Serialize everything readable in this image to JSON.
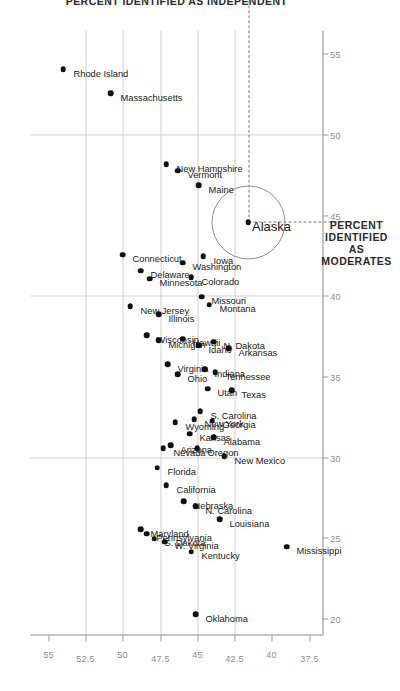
{
  "chart_data": {
    "type": "scatter",
    "title": "",
    "xlabel": "PERCENT IDENTIFIED AS INDEPENDENT",
    "ylabel": "PERCENT IDENTIFIED AS MODERATES",
    "xlim": [
      19.0,
      56.5
    ],
    "ylim": [
      36.6,
      56.2
    ],
    "xticks": [
      20,
      25,
      30,
      35,
      40,
      45,
      50,
      55
    ],
    "xticklabels": [
      "20",
      "25",
      "30",
      "35",
      "40",
      "45",
      "50",
      "55"
    ],
    "yticks": [
      37.5,
      40,
      42.5,
      45,
      47.5,
      50,
      52.5,
      55
    ],
    "yticklabels": [
      "37.5",
      "40",
      "42.5",
      "45",
      "47.5",
      "50",
      "52.5",
      "55"
    ],
    "grid": true,
    "gridlines_x": [
      30,
      40,
      50
    ],
    "gridlines_y": [
      42.5,
      45,
      47.5,
      50,
      52.5
    ],
    "legend": "none",
    "point_color": "#111111",
    "grid_color": "#cfcfcf",
    "highlight": {
      "label": "Alaska",
      "x": 44.6,
      "y": 41.6,
      "marker": "circle-outline",
      "crosshair": "dashed"
    },
    "points": [
      {
        "label": "Rhode Island",
        "x": 54.1,
        "y": 54.0
      },
      {
        "label": "Massachusetts",
        "x": 52.6,
        "y": 50.8
      },
      {
        "label": "New Hampshire",
        "x": 48.2,
        "y": 47.1
      },
      {
        "label": "Vermont",
        "x": 47.8,
        "y": 46.3
      },
      {
        "label": "Maine",
        "x": 46.9,
        "y": 44.9
      },
      {
        "label": "Connecticut",
        "x": 42.6,
        "y": 50.0
      },
      {
        "label": "Delaware",
        "x": 41.6,
        "y": 48.8
      },
      {
        "label": "Minnesota",
        "x": 41.1,
        "y": 48.2
      },
      {
        "label": "New Jersey",
        "x": 39.4,
        "y": 49.5
      },
      {
        "label": "Illinois",
        "x": 38.9,
        "y": 47.6
      },
      {
        "label": "Washington",
        "x": 42.1,
        "y": 46.0
      },
      {
        "label": "Colorado",
        "x": 41.2,
        "y": 45.4
      },
      {
        "label": "Iowa",
        "x": 42.5,
        "y": 44.6
      },
      {
        "label": "Missouri",
        "x": 40.0,
        "y": 44.7
      },
      {
        "label": "Montana",
        "x": 39.5,
        "y": 44.2
      },
      {
        "label": "Wisconsin",
        "x": 37.6,
        "y": 48.4
      },
      {
        "label": "Michigan",
        "x": 37.3,
        "y": 47.6
      },
      {
        "label": "Hawaii",
        "x": 37.4,
        "y": 46.0
      },
      {
        "label": "Virginia",
        "x": 35.8,
        "y": 47.0
      },
      {
        "label": "Ohio",
        "x": 35.2,
        "y": 46.3
      },
      {
        "label": "Idaho",
        "x": 37.0,
        "y": 44.9
      },
      {
        "label": "N. Dakota",
        "x": 37.2,
        "y": 43.9
      },
      {
        "label": "Arkansas",
        "x": 36.8,
        "y": 42.9
      },
      {
        "label": "Indiana",
        "x": 35.5,
        "y": 44.5
      },
      {
        "label": "Tennessee",
        "x": 35.3,
        "y": 43.8
      },
      {
        "label": "Utah",
        "x": 34.3,
        "y": 44.3
      },
      {
        "label": "S. Carolina",
        "x": 32.9,
        "y": 44.8
      },
      {
        "label": "New York",
        "x": 32.4,
        "y": 45.2
      },
      {
        "label": "Texas",
        "x": 34.2,
        "y": 42.7
      },
      {
        "label": "Georgia",
        "x": 32.3,
        "y": 44.0
      },
      {
        "label": "Kansas",
        "x": 31.5,
        "y": 45.5
      },
      {
        "label": "Wyoming",
        "x": 32.2,
        "y": 46.5
      },
      {
        "label": "Arizona",
        "x": 30.8,
        "y": 46.8
      },
      {
        "label": "Nevada",
        "x": 30.6,
        "y": 47.3
      },
      {
        "label": "Alabama",
        "x": 31.3,
        "y": 43.9
      },
      {
        "label": "New Mexico",
        "x": 30.1,
        "y": 43.2
      },
      {
        "label": "Oregon",
        "x": 30.6,
        "y": 45.0
      },
      {
        "label": "Florida",
        "x": 29.4,
        "y": 47.7
      },
      {
        "label": "California",
        "x": 28.3,
        "y": 47.1
      },
      {
        "label": "Nebraska",
        "x": 27.3,
        "y": 45.9
      },
      {
        "label": "N. Carolina",
        "x": 27.0,
        "y": 45.1
      },
      {
        "label": "Louisiana",
        "x": 26.2,
        "y": 43.5
      },
      {
        "label": "Maryland",
        "x": 25.6,
        "y": 48.8
      },
      {
        "label": "Pennsylvania",
        "x": 25.3,
        "y": 48.4
      },
      {
        "label": "S. Dakota",
        "x": 25.0,
        "y": 47.9
      },
      {
        "label": "W. Virginia",
        "x": 24.8,
        "y": 47.2
      },
      {
        "label": "Kentucky",
        "x": 24.2,
        "y": 45.4
      },
      {
        "label": "Oklahoma",
        "x": 20.3,
        "y": 45.1
      },
      {
        "label": "Mississippi",
        "x": 24.5,
        "y": 39.0
      }
    ]
  }
}
